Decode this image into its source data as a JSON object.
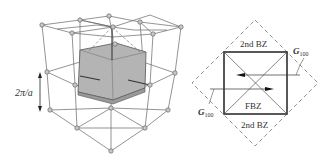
{
  "figure": {
    "left_panel": {
      "description": "3D simple cubic reciprocal lattice with shaded first Brillouin zone",
      "spacing_label": "2π/a"
    },
    "right_panel": {
      "description": "2D cross-section of Brillouin zones",
      "first_zone_label": "FBZ",
      "second_zone_top_label": "2nd BZ",
      "second_zone_bottom_label": "2nd BZ",
      "vector_top_label": "G",
      "vector_top_subscript": "100",
      "vector_bottom_label": "G",
      "vector_bottom_subscript": "100"
    },
    "colors": {
      "line": "#555555",
      "node_fill": "#bbbbbb",
      "zone_fill": "#a9a9a9",
      "dashed": "#777777"
    }
  }
}
